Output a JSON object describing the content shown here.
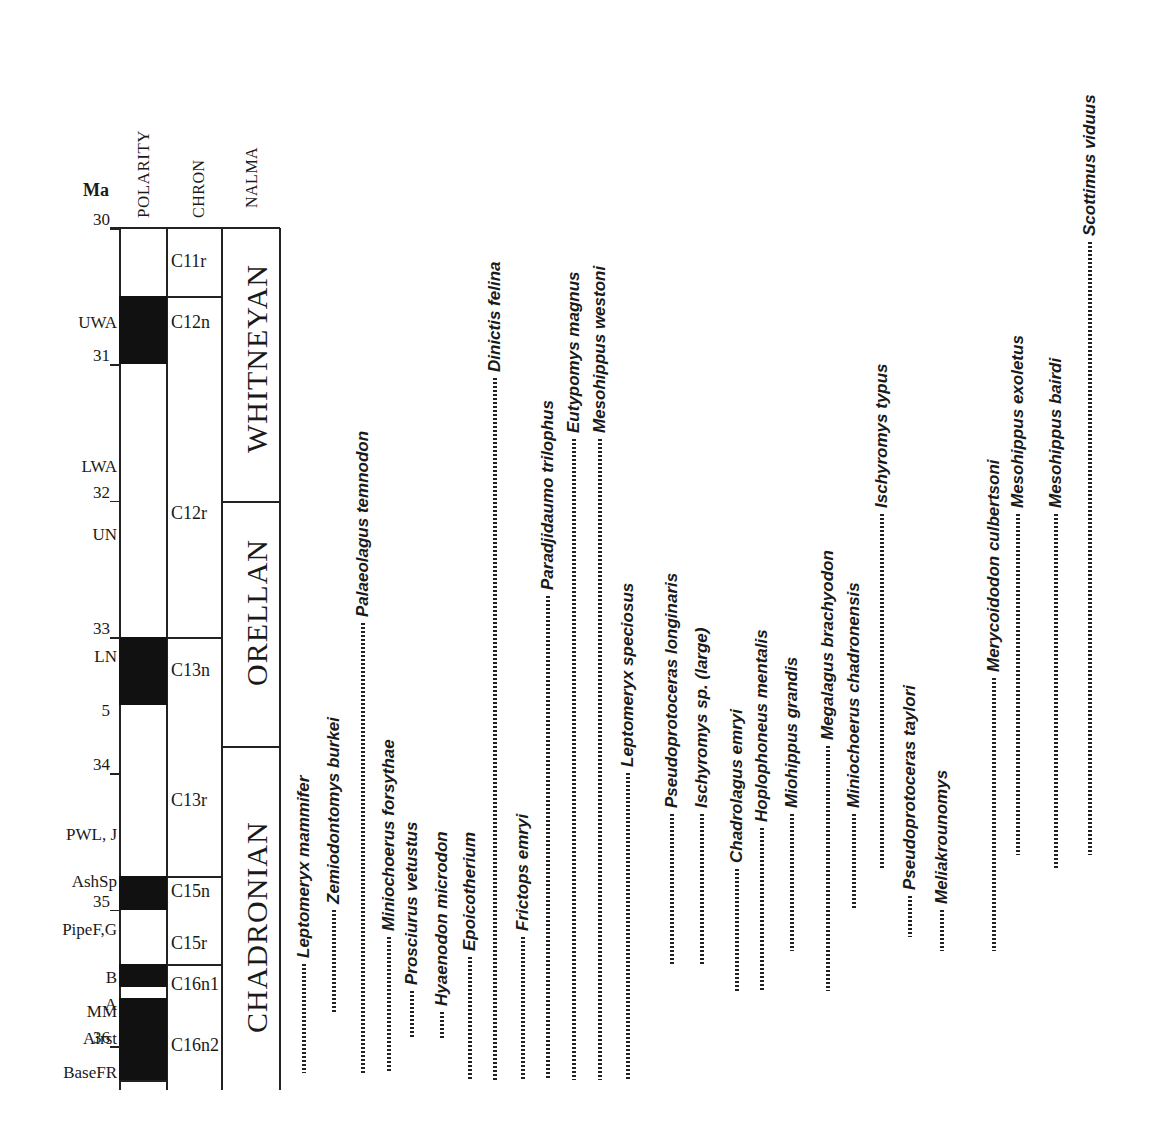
{
  "figure": {
    "column_headers": {
      "ma": "Ma",
      "polarity": "POLARITY",
      "chron": "CHRON",
      "nalma": "NALMA"
    },
    "age_scale": {
      "unit": "Ma",
      "ticks": [
        {
          "label": "30",
          "ma": 30.0
        },
        {
          "label": "31",
          "ma": 31.0
        },
        {
          "label": "32",
          "ma": 32.0
        },
        {
          "label": "33",
          "ma": 33.0
        },
        {
          "label": "5",
          "ma": 33.6
        },
        {
          "label": "34",
          "ma": 34.0
        },
        {
          "label": "35",
          "ma": 35.0
        },
        {
          "label": "36",
          "ma": 36.0
        }
      ]
    },
    "stratigraphic_levels": [
      {
        "label": "UWA",
        "ma": 30.7
      },
      {
        "label": "LWA",
        "ma": 31.75
      },
      {
        "label": "UN",
        "ma": 32.25
      },
      {
        "label": "LN",
        "ma": 33.15
      },
      {
        "label": "PWL, J",
        "ma": 34.45
      },
      {
        "label": "AshSp",
        "ma": 34.8
      },
      {
        "label": "PipeF,G",
        "ma": 35.15
      },
      {
        "label": "B",
        "ma": 35.5
      },
      {
        "label": "A",
        "ma": 35.7
      },
      {
        "label": "MM",
        "ma": 35.75
      },
      {
        "label": "Airst",
        "ma": 35.95
      },
      {
        "label": "BaseFR",
        "ma": 36.2
      }
    ],
    "polarity_intervals": [
      {
        "from": 30.0,
        "to": 30.5,
        "state": "reversed"
      },
      {
        "from": 30.5,
        "to": 31.0,
        "state": "normal"
      },
      {
        "from": 31.0,
        "to": 33.0,
        "state": "reversed"
      },
      {
        "from": 33.0,
        "to": 33.5,
        "state": "normal"
      },
      {
        "from": 33.5,
        "to": 34.75,
        "state": "reversed"
      },
      {
        "from": 34.75,
        "to": 35.0,
        "state": "normal"
      },
      {
        "from": 35.0,
        "to": 35.4,
        "state": "reversed"
      },
      {
        "from": 35.4,
        "to": 35.57,
        "state": "normal"
      },
      {
        "from": 35.57,
        "to": 35.65,
        "state": "reversed"
      },
      {
        "from": 35.65,
        "to": 36.25,
        "state": "normal"
      }
    ],
    "chrons": [
      {
        "label": "C11r",
        "from": 30.0,
        "to": 30.5
      },
      {
        "label": "C12n",
        "from": 30.5,
        "to": 33.0,
        "label_at": 30.7
      },
      {
        "label": "C12r",
        "from": 30.5,
        "to": 33.0,
        "label_at": 32.1
      },
      {
        "label": "C13n",
        "from": 33.0,
        "to": 34.75,
        "label_at": 33.25
      },
      {
        "label": "C13r",
        "from": 33.0,
        "to": 34.75,
        "label_at": 34.2
      },
      {
        "label": "C15n",
        "from": 34.75,
        "to": 35.4,
        "label_at": 34.87
      },
      {
        "label": "C15r",
        "from": 34.75,
        "to": 35.4,
        "label_at": 35.25
      },
      {
        "label": "C16n1",
        "from": 35.4,
        "to": 36.3,
        "label_at": 35.55
      },
      {
        "label": "C16n2",
        "from": 35.4,
        "to": 36.3,
        "label_at": 36.0
      }
    ],
    "nalma": [
      {
        "label": "WHITNEYAN",
        "from": 30.0,
        "to": 32.0
      },
      {
        "label": "ORELLAN",
        "from": 32.0,
        "to": 33.8
      },
      {
        "label": "CHADRONIAN",
        "from": 33.8,
        "to": 36.3
      }
    ],
    "taxa": [
      {
        "name": "Leptomeryx mammifer",
        "top": 35.4,
        "base": 36.2,
        "x": 302
      },
      {
        "name": "Zemiodontomys burkei",
        "top": 35.0,
        "base": 35.75,
        "x": 332
      },
      {
        "name": "Palaeolagus temnodon",
        "top": 32.9,
        "base": 36.2,
        "x": 361
      },
      {
        "name": "Miniochoerus forsythae",
        "top": 35.2,
        "base": 36.2,
        "x": 387
      },
      {
        "name": "Prosciurus vetustus",
        "top": 35.6,
        "base": 35.95,
        "x": 410
      },
      {
        "name": "Hyaenodon microdon",
        "top": 35.75,
        "base": 35.95,
        "x": 440
      },
      {
        "name": "Epoicotherium",
        "top": 35.35,
        "base": 36.25,
        "x": 468
      },
      {
        "name": "Dinictis felina",
        "top": 31.1,
        "base": 36.25,
        "x": 493
      },
      {
        "name": "Frictops emryi",
        "top": 35.2,
        "base": 36.25,
        "x": 521
      },
      {
        "name": "Paradjidaumo trilophus",
        "top": 32.7,
        "base": 36.25,
        "x": 546
      },
      {
        "name": "Eutypomys magnus",
        "top": 31.55,
        "base": 36.25,
        "x": 572
      },
      {
        "name": "Mesohippus westoni",
        "top": 31.55,
        "base": 36.25,
        "x": 598
      },
      {
        "name": "Leptomeryx speciosus",
        "top": 34.0,
        "base": 36.25,
        "x": 626
      },
      {
        "name": "Pseudoprotoceras longinaris",
        "top": 34.3,
        "base": 35.4,
        "x": 670
      },
      {
        "name": "Ischyromys sp. (large)",
        "top": 34.3,
        "base": 35.4,
        "x": 700,
        "plain_suffix": true
      },
      {
        "name": "Chadrolagus emryi",
        "top": 34.7,
        "base": 35.6,
        "x": 735
      },
      {
        "name": "Hoplophoneus mentalis",
        "top": 34.4,
        "base": 35.6,
        "x": 760
      },
      {
        "name": "Miohippus grandis",
        "top": 34.3,
        "base": 35.3,
        "x": 790
      },
      {
        "name": "Megalagus brachyodon",
        "top": 33.8,
        "base": 35.6,
        "x": 826
      },
      {
        "name": "Miniochoerus chadronensis",
        "top": 34.3,
        "base": 35.0,
        "x": 852
      },
      {
        "name": "Ischyromys typus",
        "top": 32.1,
        "base": 34.7,
        "x": 880
      },
      {
        "name": "Pseudoprotoceras taylori",
        "top": 34.9,
        "base": 35.2,
        "x": 908
      },
      {
        "name": "Meliakrounomys",
        "top": 35.0,
        "base": 35.3,
        "x": 940
      },
      {
        "name": "Merycoidodon culbertsoni",
        "top": 33.3,
        "base": 35.3,
        "x": 992
      },
      {
        "name": "Mesohippus exoletus",
        "top": 32.1,
        "base": 34.6,
        "x": 1016
      },
      {
        "name": "Mesohippus bairdi",
        "top": 32.1,
        "base": 34.7,
        "x": 1054
      },
      {
        "name": "Scottimus viduus",
        "top": 30.1,
        "base": 34.6,
        "x": 1088
      }
    ]
  }
}
